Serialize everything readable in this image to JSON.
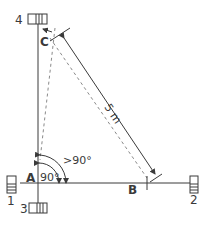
{
  "diagram": {
    "type": "surveying-right-angle-layout",
    "points": {
      "A": "A",
      "B": "B",
      "C": "C"
    },
    "stakes": [
      {
        "id": "1",
        "label": "1"
      },
      {
        "id": "2",
        "label": "2"
      },
      {
        "id": "3",
        "label": "3"
      },
      {
        "id": "4",
        "label": "4"
      }
    ],
    "measurement": "5 m",
    "angles": {
      "right": "90°",
      "obtuse": ">90°"
    },
    "colors": {
      "line": "#3a3a3a",
      "dashed": "#8a8a8a",
      "stake_fill": "#ffffff"
    }
  }
}
